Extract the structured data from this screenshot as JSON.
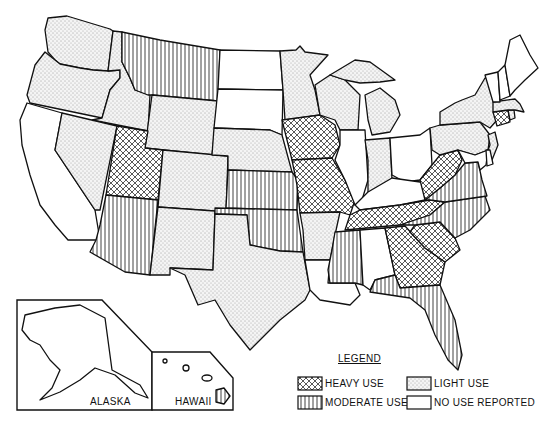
{
  "map": {
    "title": "",
    "categories": {
      "heavy": {
        "label": "HEAVY USE",
        "pattern": "crosshatch"
      },
      "moderate": {
        "label": "MODERATE USE",
        "pattern": "vertical-lines"
      },
      "light": {
        "label": "LIGHT USE",
        "pattern": "stipple"
      },
      "none": {
        "label": "NO USE REPORTED",
        "pattern": "blank"
      }
    },
    "states": {
      "WA": "light",
      "OR": "light",
      "CA": "none",
      "ID": "light",
      "NV": "light",
      "MT": "moderate",
      "WY": "light",
      "UT": "heavy",
      "CO": "light",
      "AZ": "moderate",
      "NM": "light",
      "ND": "none",
      "SD": "none",
      "NE": "light",
      "KS": "moderate",
      "OK": "moderate",
      "TX": "light",
      "MN": "light",
      "IA": "heavy",
      "MO": "heavy",
      "AR": "light",
      "LA": "none",
      "WI": "light",
      "IL": "none",
      "MI": "light",
      "IN": "light",
      "OH": "none",
      "KY": "none",
      "TN": "heavy",
      "MS": "moderate",
      "AL": "none",
      "GA": "heavy",
      "FL": "moderate",
      "SC": "heavy",
      "NC": "moderate",
      "VA": "moderate",
      "WV": "heavy",
      "PA": "light",
      "NY": "light",
      "NJ": "light",
      "MD": "none",
      "DE": "none",
      "CT": "heavy",
      "RI": "light",
      "MA": "light",
      "VT": "none",
      "NH": "none",
      "ME": "none",
      "AK": "none",
      "HI": "moderate"
    },
    "insets": {
      "alaska_label": "ALASKA",
      "hawaii_label": "HAWAII"
    }
  },
  "legend": {
    "title": "LEGEND",
    "items": [
      {
        "key": "heavy",
        "label": "HEAVY USE"
      },
      {
        "key": "light",
        "label": "LIGHT USE"
      },
      {
        "key": "moderate",
        "label": "MODERATE USE"
      },
      {
        "key": "none",
        "label": "NO USE REPORTED"
      }
    ]
  }
}
